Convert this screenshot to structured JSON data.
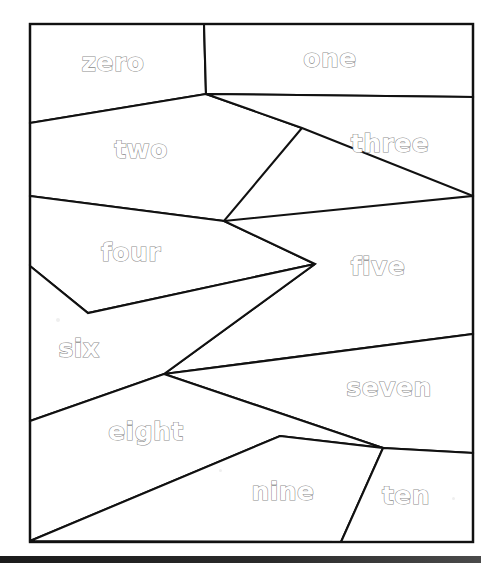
{
  "figure": {
    "canvas": {
      "width": 481,
      "height": 566
    },
    "style": {
      "background_color": "#ffffff",
      "line_color": "#111111",
      "label_fill_color": "#ffffff",
      "label_outline_color": "#8d8d8d",
      "bar_color": "#1b1b1b"
    },
    "frame": {
      "x": 30,
      "y": 24,
      "width": 443,
      "height": 518
    },
    "bottom_bar": {
      "y": 556,
      "height": 7
    }
  },
  "regions": [
    {
      "id": "region-zero",
      "label": "zero",
      "index": 0,
      "label_x": 113,
      "label_y": 64,
      "points": "30,24 204,24 206,94 30,123"
    },
    {
      "id": "region-one",
      "label": "one",
      "index": 1,
      "label_x": 330,
      "label_y": 60,
      "points": "204,24 473,24 473,97 206,94"
    },
    {
      "id": "region-two",
      "label": "two",
      "index": 2,
      "label_x": 141,
      "label_y": 151,
      "points": "30,123 206,94 302,128 224,221 30,196"
    },
    {
      "id": "region-three",
      "label": "three",
      "index": 3,
      "label_x": 390,
      "label_y": 145,
      "points": "206,94 473,97 473,196 302,128"
    },
    {
      "id": "region-four",
      "label": "four",
      "index": 4,
      "label_x": 131,
      "label_y": 254,
      "points": "30,196 224,221 315,264 88,313 30,266"
    },
    {
      "id": "region-five",
      "label": "five",
      "index": 5,
      "label_x": 378,
      "label_y": 268,
      "points": "224,221 473,196 473,334 164,374 315,264"
    },
    {
      "id": "region-six",
      "label": "six",
      "index": 6,
      "label_x": 79,
      "label_y": 350,
      "points": "30,266 88,313 315,264 164,374 30,421"
    },
    {
      "id": "region-seven",
      "label": "seven",
      "index": 7,
      "label_x": 389,
      "label_y": 389,
      "points": "164,374 473,334 473,453 383,448"
    },
    {
      "id": "region-eight",
      "label": "eight",
      "index": 8,
      "label_x": 146,
      "label_y": 433,
      "points": "164,374 383,448 280,436 30,541 30,421"
    },
    {
      "id": "region-nine",
      "label": "nine",
      "index": 9,
      "label_x": 283,
      "label_y": 493,
      "points": "280,436 383,448 341,542 30,541"
    },
    {
      "id": "region-ten",
      "label": "ten",
      "index": 10,
      "label_x": 406,
      "label_y": 497,
      "points": "383,448 473,453 473,542 341,542"
    }
  ],
  "specks": [
    {
      "x": 56,
      "y": 318,
      "size": 4
    },
    {
      "x": 452,
      "y": 497,
      "size": 3
    },
    {
      "x": 219,
      "y": 469,
      "size": 3
    }
  ]
}
